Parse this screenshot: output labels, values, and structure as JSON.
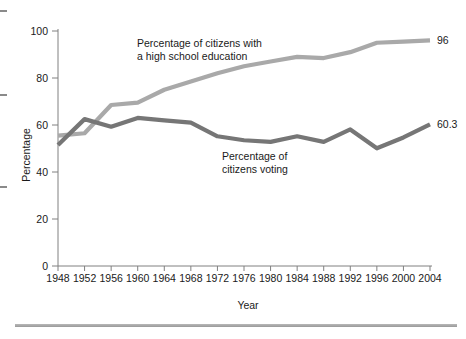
{
  "chart_data": {
    "type": "line",
    "title": "",
    "xlabel": "Year",
    "ylabel": "Percentage",
    "xlim": [
      1948,
      2004
    ],
    "ylim": [
      0,
      100
    ],
    "grid": false,
    "legend_position": "inline-annotations",
    "x": [
      1948,
      1952,
      1956,
      1960,
      1964,
      1968,
      1972,
      1976,
      1980,
      1984,
      1988,
      1992,
      1996,
      2000,
      2004
    ],
    "xticklabels": [
      "1948",
      "1952",
      "1956",
      "1960",
      "1964",
      "1968",
      "1972",
      "1976",
      "1980",
      "1984",
      "1988",
      "1992",
      "1996",
      "2000",
      "2004"
    ],
    "yticks": [
      0,
      20,
      40,
      60,
      80,
      100
    ],
    "yticklabels": [
      "0",
      "20",
      "40",
      "60",
      "80",
      "100"
    ],
    "series": [
      {
        "name": "Percentage of citizens with a high school education",
        "color": "#a9a9a9",
        "values": [
          55.5,
          56.5,
          68.5,
          69.5,
          75.0,
          78.5,
          82.0,
          85.0,
          87.0,
          89.0,
          88.5,
          91.0,
          95.0,
          95.5,
          96.0
        ],
        "end_label": "96"
      },
      {
        "name": "Percentage of citizens voting",
        "color": "#767676",
        "values": [
          51.5,
          62.5,
          59.3,
          63.0,
          62.0,
          61.0,
          55.2,
          53.5,
          52.8,
          55.2,
          52.8,
          58.1,
          50.1,
          54.7,
          60.3
        ],
        "end_label": "60.3"
      }
    ],
    "annotations": [
      {
        "id": "education-annotation",
        "lines": [
          "Percentage of citizens with",
          "a high school education"
        ],
        "x": 137,
        "y": 47
      },
      {
        "id": "voting-annotation",
        "lines": [
          "Percentage of",
          "citizens voting"
        ],
        "x": 222,
        "y": 160
      }
    ],
    "end_labels": [
      {
        "id": "education-end-label",
        "text": "96",
        "value": 96
      },
      {
        "id": "voting-end-label",
        "text": "60.3",
        "value": 60.3
      }
    ]
  },
  "axes": {
    "y_axis_title": "Percentage",
    "x_axis_title": "Year"
  },
  "margin_marks": {
    "glyph": ""
  }
}
